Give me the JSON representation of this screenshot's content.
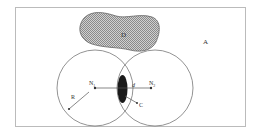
{
  "diagram": {
    "colors": {
      "background": "#ffffff",
      "frame": "#bbbbbb",
      "stroke": "#555555",
      "lens_fill": "#1a1a1a",
      "obstacle_fill": "#b5b5b5"
    },
    "labels": {
      "area": "A",
      "obstacle": "D",
      "node1_main": "N",
      "node1_sub": "1",
      "node2_main": "N",
      "node2_sub": "2",
      "distance": "d",
      "radius": "R",
      "overlap": "C"
    }
  }
}
